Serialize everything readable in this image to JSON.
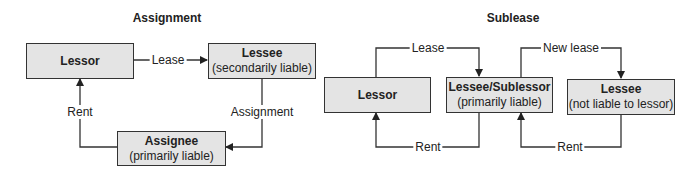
{
  "assignment": {
    "title": "Assignment",
    "nodes": {
      "lessor": {
        "name": "Lessor",
        "note": ""
      },
      "lessee": {
        "name": "Lessee",
        "note": "(secondarily liable)"
      },
      "assignee": {
        "name": "Assignee",
        "note": "(primarily liable)"
      }
    },
    "edges": {
      "lease": "Lease",
      "assignment": "Assignment",
      "rent": "Rent"
    }
  },
  "sublease": {
    "title": "Sublease",
    "nodes": {
      "lessor": {
        "name": "Lessor",
        "note": ""
      },
      "sublessor": {
        "name": "Lessee/Sublessor",
        "note": "(primarily liable)"
      },
      "lessee": {
        "name": "Lessee",
        "note": "(not liable to lessor)"
      }
    },
    "edges": {
      "lease": "Lease",
      "new_lease": "New lease",
      "rent1": "Rent",
      "rent2": "Rent"
    }
  },
  "colors": {
    "box_fill": "#e4e4e4",
    "line": "#333333"
  }
}
